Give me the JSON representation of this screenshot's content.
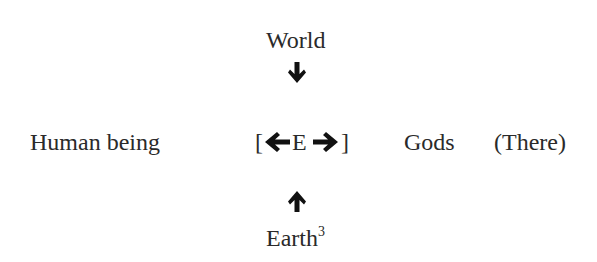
{
  "diagram": {
    "top_label": "World",
    "bottom_label": "Earth",
    "bottom_label_footnote": "3",
    "left_label": "Human being",
    "center_open_bracket": "[",
    "center_label": "E",
    "center_close_bracket": "]",
    "right_label": "Gods",
    "right_annotation": "(There)",
    "arrows": {
      "top": "down",
      "bottom": "up",
      "center_left": "left",
      "center_right": "right"
    },
    "colors": {
      "text": "#2a2a2a",
      "arrow": "#111111"
    }
  }
}
